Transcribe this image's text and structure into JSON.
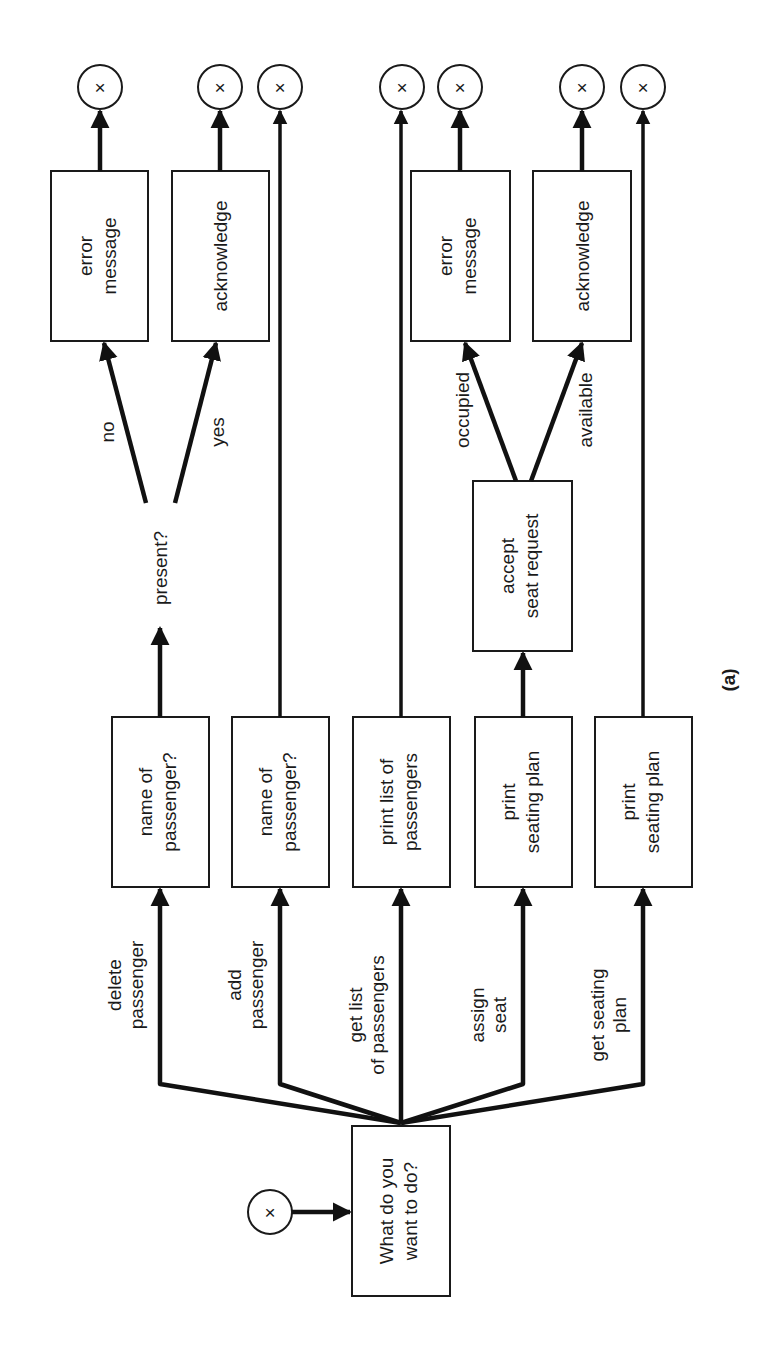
{
  "figure": {
    "caption": "(a)",
    "orientation": "rotated 90° counter-clockwise (text reads bottom-to-top)"
  },
  "start": {
    "terminal_symbol": "×",
    "question": [
      "What do you",
      "want to do?"
    ]
  },
  "branches": [
    {
      "label": [
        "delete",
        "passenger"
      ],
      "step": [
        "name of",
        "passenger?"
      ],
      "decision": "present?",
      "outcomes": [
        {
          "label": "no",
          "action": [
            "error",
            "message"
          ],
          "terminal": "×"
        },
        {
          "label": "yes",
          "action": [
            "acknowledge"
          ],
          "terminal": "×"
        }
      ]
    },
    {
      "label": [
        "add",
        "passenger"
      ],
      "step": [
        "name of",
        "passenger?"
      ],
      "terminal": "×"
    },
    {
      "label": [
        "get list",
        "of passengers"
      ],
      "step": [
        "print list of",
        "passengers"
      ],
      "terminal": "×"
    },
    {
      "label": [
        "assign",
        "seat"
      ],
      "step": [
        "print",
        "seating plan"
      ],
      "sub_step": [
        "accept",
        "seat request"
      ],
      "outcomes": [
        {
          "label": "occupied",
          "action": [
            "error",
            "message"
          ],
          "terminal": "×"
        },
        {
          "label": "available",
          "action": [
            "acknowledge"
          ],
          "terminal": "×"
        }
      ]
    },
    {
      "label": [
        "get seating",
        "plan"
      ],
      "step": [
        "print",
        "seating plan"
      ],
      "terminal": "×"
    }
  ]
}
